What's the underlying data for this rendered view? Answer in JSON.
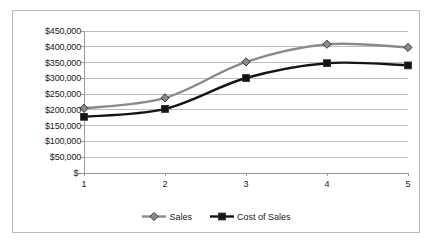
{
  "chart_data": {
    "type": "line",
    "title": "",
    "subtitle": "",
    "xlabel": "",
    "ylabel": "",
    "categories": [
      "1",
      "2",
      "3",
      "4",
      "5"
    ],
    "ylim": [
      0,
      450000
    ],
    "ytick_values": [
      0,
      50000,
      100000,
      150000,
      200000,
      250000,
      300000,
      350000,
      400000,
      450000
    ],
    "ytick_labels": [
      "$-",
      "$50,000",
      "$100,000",
      "$150,000",
      "$200,000",
      "$250,000",
      "$300,000",
      "$350,000",
      "$400,000",
      "$450,000"
    ],
    "grid": true,
    "legend_position": "bottom",
    "series": [
      {
        "name": "Sales",
        "color": "#8a8a8a",
        "marker": "diamond",
        "values": [
          205000,
          238000,
          352000,
          408000,
          398000
        ]
      },
      {
        "name": "Cost of Sales",
        "color": "#141414",
        "marker": "square",
        "values": [
          178000,
          203000,
          301000,
          348000,
          341000
        ]
      }
    ]
  },
  "colors": {
    "frame_border": "#b9b9b9",
    "gridline": "#bdbdbd",
    "axis_line": "#9a9a9a",
    "background": "#ffffff",
    "text": "#1a1a1a"
  }
}
